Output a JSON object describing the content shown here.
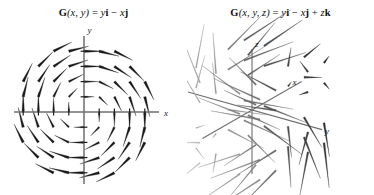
{
  "figure": {
    "background_color": "#ffffff",
    "panels": [
      {
        "id": "panel-2d",
        "title_parts": {
          "fn": "G",
          "args": "(x, y)",
          "eq": " = ",
          "expr": "y i − x j"
        },
        "title_plain": "G(x, y) = yi − xj",
        "axes": {
          "x_label": "x",
          "y_label": "y",
          "axis_color": "#6e6e6e",
          "tick_count_x": 8,
          "tick_count_y": 8
        },
        "arrow_color": "#1a1a1a",
        "field_type": "2d-rotational-clockwise"
      },
      {
        "id": "panel-3d",
        "title_parts": {
          "fn": "G",
          "args": "(x, y, z)",
          "eq": " = ",
          "expr": "y i − x j + z k"
        },
        "title_plain": "G(x, y, z) = yi − xj + zk",
        "axes": {
          "x_label": "x",
          "y_label": "y",
          "z_label": "z",
          "axis_color": "#6e6e6e"
        },
        "arrow_color_near": "#2a2a2a",
        "arrow_color_far": "#b8b8b8",
        "field_type": "3d-helical"
      }
    ]
  },
  "chart_data": [
    {
      "type": "scatter",
      "subtype": "vector-field-2d",
      "title": "G(x, y) = yi − xj",
      "xlabel": "x",
      "ylabel": "y",
      "xlim": [
        -4.5,
        4.5
      ],
      "ylim": [
        -4.5,
        4.5
      ],
      "grid": false,
      "legend": null,
      "formula": "G(x, y) = y i − x j",
      "description": "Clockwise rotational planar vector field; arrow length grows with distance from origin.",
      "sample_points": [
        {
          "x": -3,
          "y": 3,
          "u": 3,
          "v": 3
        },
        {
          "x": 0,
          "y": 3,
          "u": 3,
          "v": 0
        },
        {
          "x": 3,
          "y": 3,
          "u": 3,
          "v": -3
        },
        {
          "x": -3,
          "y": 0,
          "u": 0,
          "v": 3
        },
        {
          "x": 0,
          "y": 0,
          "u": 0,
          "v": 0
        },
        {
          "x": 3,
          "y": 0,
          "u": 0,
          "v": -3
        },
        {
          "x": -3,
          "y": -3,
          "u": -3,
          "v": 3
        },
        {
          "x": 0,
          "y": -3,
          "u": -3,
          "v": 0
        },
        {
          "x": 3,
          "y": -3,
          "u": -3,
          "v": -3
        }
      ],
      "grid_points_x": [
        -4,
        -3,
        -2,
        -1,
        0,
        1,
        2,
        3,
        4
      ],
      "grid_points_y": [
        -4,
        -3,
        -2,
        -1,
        0,
        1,
        2,
        3,
        4
      ]
    },
    {
      "type": "scatter",
      "subtype": "vector-field-3d",
      "title": "G(x, y, z) = yi − xj + zk",
      "xlabel": "x",
      "ylabel": "y",
      "zlabel": "z",
      "xlim": [
        -2.5,
        2.5
      ],
      "ylim": [
        -2.5,
        2.5
      ],
      "zlim": [
        -2.5,
        2.5
      ],
      "grid": false,
      "legend": null,
      "formula": "G(x, y, z) = y i − x j + z k",
      "description": "Helical / swirling spatial vector field: rotation about the z-axis combined with vertical stretching proportional to z.",
      "sample_points": [
        {
          "x": -2,
          "y": 2,
          "z": 2,
          "u": 2,
          "v": 2,
          "w": 2
        },
        {
          "x": 2,
          "y": 2,
          "z": 2,
          "u": 2,
          "v": -2,
          "w": 2
        },
        {
          "x": 2,
          "y": -2,
          "z": 2,
          "u": -2,
          "v": -2,
          "w": 2
        },
        {
          "x": -2,
          "y": -2,
          "z": 2,
          "u": -2,
          "v": 2,
          "w": 2
        },
        {
          "x": -2,
          "y": 2,
          "z": -2,
          "u": 2,
          "v": 2,
          "w": -2
        },
        {
          "x": 2,
          "y": 2,
          "z": -2,
          "u": 2,
          "v": -2,
          "w": -2
        },
        {
          "x": 2,
          "y": -2,
          "z": -2,
          "u": -2,
          "v": -2,
          "w": -2
        },
        {
          "x": -2,
          "y": -2,
          "z": -2,
          "u": -2,
          "v": 2,
          "w": -2
        },
        {
          "x": 0,
          "y": 0,
          "z": 0,
          "u": 0,
          "v": 0,
          "w": 0
        }
      ],
      "grid_points_x": [
        -2,
        0,
        2
      ],
      "grid_points_y": [
        -2,
        0,
        2
      ],
      "grid_points_z": [
        -2,
        0,
        2
      ]
    }
  ]
}
